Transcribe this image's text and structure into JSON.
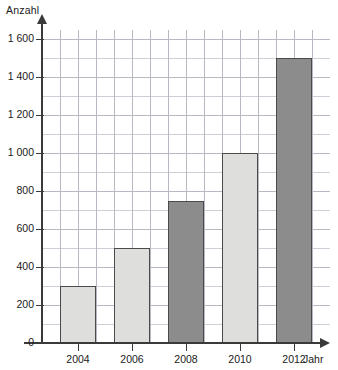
{
  "chart_data": {
    "type": "bar",
    "title": "",
    "subtitle": "",
    "xlabel": "Jahr",
    "ylabel": "Anzahl",
    "categories": [
      "2004",
      "2006",
      "2008",
      "2010",
      "2012"
    ],
    "values": [
      300,
      500,
      750,
      1000,
      1500
    ],
    "series": [
      {
        "name": "Anzahl",
        "values": [
          300,
          500,
          750,
          1000,
          1500
        ]
      }
    ],
    "bar_colors": [
      "#dededc",
      "#dededc",
      "#8c8c8c",
      "#dededc",
      "#8c8c8c"
    ],
    "bar_shades": [
      "light",
      "light",
      "dark",
      "light",
      "dark"
    ],
    "ylim": [
      0,
      1600
    ],
    "ytick_values": [
      0,
      200,
      400,
      600,
      800,
      1000,
      1200,
      1400,
      1600
    ],
    "ytick_labels": [
      "0",
      "200",
      "400",
      "600",
      "800",
      "1 000",
      "1 200",
      "1 400",
      "1 600"
    ],
    "xtick_labels": [
      "2004",
      "2006",
      "2008",
      "2010",
      "2012"
    ],
    "grid": true,
    "grid_color": "#b9b9c4",
    "minor_grid_color": "#cfcfd8",
    "legend": false,
    "legend_position": "none",
    "axis_color": "#3a3a3a",
    "background": "#ffffff",
    "annotations": []
  },
  "axes": {
    "y_title": "Anzahl",
    "x_title": "Jahr"
  },
  "y_ticks": [
    {
      "label": "1 600",
      "value": 1600
    },
    {
      "label": "1 400",
      "value": 1400
    },
    {
      "label": "1 200",
      "value": 1200
    },
    {
      "label": "1 000",
      "value": 1000
    },
    {
      "label": "800",
      "value": 800
    },
    {
      "label": "600",
      "value": 600
    },
    {
      "label": "400",
      "value": 400
    },
    {
      "label": "200",
      "value": 200
    },
    {
      "label": "0",
      "value": 0
    }
  ],
  "x_ticks": [
    {
      "label": "2004",
      "value": 300
    },
    {
      "label": "2006",
      "value": 500
    },
    {
      "label": "2008",
      "value": 750
    },
    {
      "label": "2010",
      "value": 1000
    },
    {
      "label": "2012",
      "value": 1500
    }
  ]
}
